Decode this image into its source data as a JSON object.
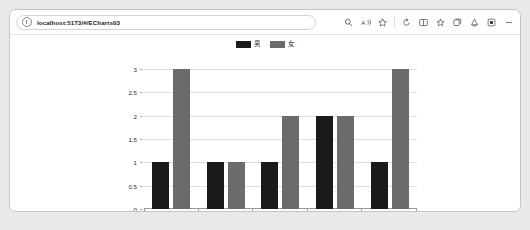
{
  "browser": {
    "address_bar": {
      "url": "localhost:5173/#/ECharts03",
      "placeholder": "Search or enter web address",
      "site_info_icon": "info-circle-icon"
    },
    "toolbar_buttons": [
      {
        "name": "search-in-page-icon",
        "label": "Find on page"
      },
      {
        "name": "read-aloud-icon",
        "label": "Read aloud"
      },
      {
        "name": "favorites-star-icon",
        "label": "Add this page to favorites"
      },
      {
        "name": "copilot-icon",
        "label": "Copilot"
      },
      {
        "name": "split-screen-icon",
        "label": "Split screen"
      },
      {
        "name": "favorites-icon",
        "label": "Favorites"
      },
      {
        "name": "collections-icon",
        "label": "Collections"
      },
      {
        "name": "browser-essentials-icon",
        "label": "Browser essentials"
      },
      {
        "name": "extensions-icon",
        "label": "Extensions"
      },
      {
        "name": "settings-more-icon",
        "label": "Settings and more"
      }
    ]
  },
  "chart_data": {
    "type": "bar",
    "title": "",
    "subtitle": "",
    "xlabel": "",
    "ylabel": "",
    "categories": [
      "1999",
      "2000",
      "2002",
      "2003",
      "2004"
    ],
    "series": [
      {
        "name": "男",
        "color": "#1a1a1a",
        "values": [
          1,
          1,
          1,
          2,
          1
        ]
      },
      {
        "name": "女",
        "color": "#6b6b6b",
        "values": [
          3,
          1,
          2,
          2,
          3
        ]
      }
    ],
    "ylim": [
      0,
      3
    ],
    "yticks": [
      "0",
      "0.5",
      "1",
      "1.5",
      "2",
      "2.5",
      "3"
    ],
    "ytick_values": [
      0,
      0.5,
      1,
      1.5,
      2,
      2.5,
      3
    ],
    "grid": true,
    "legend_position": "top-center"
  }
}
